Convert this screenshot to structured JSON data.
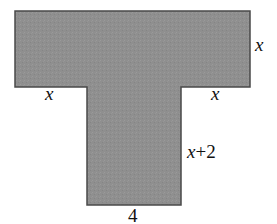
{
  "figure": {
    "type": "T-shaped composite figure",
    "fill_color": "#8e8e8e",
    "stroke_color": "#4a4a4a",
    "background_color": "#ffffff",
    "labels": {
      "top_right_side": "x",
      "bottom_left_overhang": "x",
      "bottom_right_overhang": "x",
      "stem_right_side_var": "x",
      "stem_right_side_rest": "+2",
      "stem_bottom": "4"
    }
  }
}
